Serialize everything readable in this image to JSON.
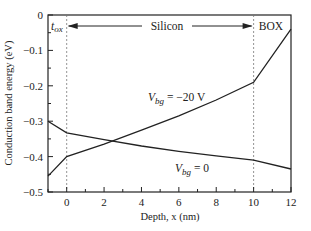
{
  "chart_data": {
    "type": "line",
    "title": "",
    "xlabel": "Depth,  x (nm)",
    "ylabel": "Conduction band energy (eV)",
    "xlim": [
      -1,
      12
    ],
    "ylim": [
      -0.5,
      0
    ],
    "x_ticks": [
      0,
      2,
      4,
      6,
      8,
      10,
      12
    ],
    "x_tick_labels": [
      "0",
      "2",
      "4",
      "6",
      "8",
      "10",
      "12"
    ],
    "y_ticks": [
      0,
      -0.1,
      -0.2,
      -0.3,
      -0.4,
      -0.5
    ],
    "y_tick_labels": [
      "0",
      "−0.1",
      "−0.2",
      "−0.3",
      "−0.4",
      "−0.5"
    ],
    "grid": false,
    "series": [
      {
        "name": "V_bg = 0",
        "label": "V",
        "sub": "bg",
        "suffix": " = 0",
        "x": [
          -1,
          0,
          2,
          4,
          6,
          8,
          10,
          12
        ],
        "y": [
          -0.3,
          -0.333,
          -0.352,
          -0.37,
          -0.385,
          -0.398,
          -0.41,
          -0.435
        ]
      },
      {
        "name": "V_bg = -20 V",
        "label": "V",
        "sub": "bg",
        "suffix": " = −20 V",
        "x": [
          -1,
          0,
          2,
          4,
          6,
          8,
          10,
          12
        ],
        "y": [
          -0.455,
          -0.4,
          -0.365,
          -0.325,
          -0.285,
          -0.24,
          -0.19,
          -0.04
        ]
      }
    ],
    "annotations": {
      "tox": "t",
      "tox_sub": "ox",
      "silicon": "Silicon",
      "box": "BOX",
      "dashed_lines_x": [
        0,
        10
      ]
    }
  }
}
